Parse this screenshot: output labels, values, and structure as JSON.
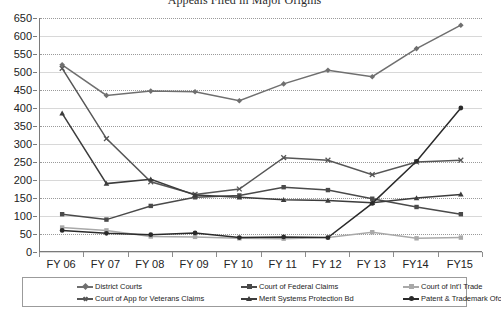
{
  "chart_data": {
    "type": "line",
    "title": "Appeals Filed in Major Origins",
    "xlabel": "",
    "ylabel": "",
    "ylim": [
      0,
      650
    ],
    "ytick_step": 50,
    "yticks": [
      0,
      50,
      100,
      150,
      200,
      250,
      300,
      350,
      400,
      450,
      500,
      550,
      600,
      650
    ],
    "grid": true,
    "legend_position": "bottom",
    "categories": [
      "FY 06",
      "FY 07",
      "FY 08",
      "FY 09",
      "FY 10",
      "FY 11",
      "FY 12",
      "FY 13",
      "FY14",
      "FY15"
    ],
    "series": [
      {
        "name": "District Courts",
        "color": "#6f6f6f",
        "marker": "diamond",
        "values": [
          520,
          435,
          447,
          445,
          420,
          467,
          505,
          487,
          565,
          630
        ]
      },
      {
        "name": "Court of Federal Claims",
        "color": "#4a4a4a",
        "marker": "square",
        "values": [
          105,
          90,
          128,
          152,
          157,
          180,
          172,
          148,
          125,
          105
        ]
      },
      {
        "name": "Court of Int'l Trade",
        "color": "#a9a9a9",
        "marker": "square",
        "values": [
          68,
          60,
          43,
          42,
          38,
          37,
          40,
          55,
          38,
          40
        ]
      },
      {
        "name": "Court of App for Veterans Claims",
        "color": "#565656",
        "marker": "x",
        "values": [
          510,
          315,
          195,
          160,
          175,
          262,
          255,
          215,
          250,
          255
        ]
      },
      {
        "name": "Merit Systems Protection Bd",
        "color": "#3c3c3c",
        "marker": "triangle",
        "values": [
          385,
          190,
          202,
          158,
          152,
          145,
          143,
          137,
          150,
          160
        ]
      },
      {
        "name": "Patent & Trademark Ofc",
        "color": "#2a2a2a",
        "marker": "circle",
        "values": [
          60,
          52,
          48,
          53,
          40,
          42,
          40,
          135,
          252,
          400
        ]
      }
    ]
  },
  "legend": {
    "entries": [
      {
        "label": "District Courts"
      },
      {
        "label": "Court of Federal Claims"
      },
      {
        "label": "Court of Int'l Trade"
      },
      {
        "label": "Court of App for Veterans Claims"
      },
      {
        "label": "Merit Systems Protection Bd"
      },
      {
        "label": "Patent & Trademark Ofc"
      }
    ]
  }
}
